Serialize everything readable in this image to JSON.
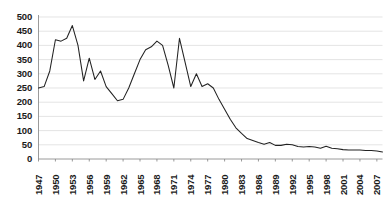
{
  "chart_data": {
    "type": "line",
    "title": "",
    "subtitle": "",
    "xlabel": "",
    "ylabel": "",
    "grid": true,
    "legend": false,
    "legend_position": "none",
    "line_color": "#222222",
    "background_color": "#ffffff",
    "gridline_color": "#d9d9d9",
    "axis_color": "#808080",
    "ylim": [
      0,
      500
    ],
    "yticks": [
      0,
      50,
      100,
      150,
      200,
      250,
      300,
      350,
      400,
      450,
      500
    ],
    "ytick_labels": [
      "0",
      "50",
      "100",
      "150",
      "200",
      "250",
      "300",
      "350",
      "400",
      "450",
      "500"
    ],
    "xlim": [
      1947,
      2008
    ],
    "xticks": [
      1947,
      1950,
      1953,
      1956,
      1959,
      1962,
      1965,
      1968,
      1971,
      1974,
      1977,
      1980,
      1983,
      1986,
      1989,
      1992,
      1995,
      1998,
      2001,
      2004,
      2007
    ],
    "xtick_labels": [
      "1947",
      "1950",
      "1953",
      "1956",
      "1959",
      "1962",
      "1965",
      "1968",
      "1971",
      "1974",
      "1977",
      "1980",
      "1983",
      "1986",
      "1989",
      "1992",
      "1995",
      "1998",
      "2001",
      "2004",
      "2007"
    ],
    "xtick_rotation": 90,
    "x": [
      1947,
      1948,
      1949,
      1950,
      1951,
      1952,
      1953,
      1954,
      1955,
      1956,
      1957,
      1958,
      1959,
      1960,
      1961,
      1962,
      1963,
      1964,
      1965,
      1966,
      1967,
      1968,
      1969,
      1970,
      1971,
      1972,
      1973,
      1974,
      1975,
      1976,
      1977,
      1978,
      1979,
      1980,
      1981,
      1982,
      1983,
      1984,
      1985,
      1986,
      1987,
      1988,
      1989,
      1990,
      1991,
      1992,
      1993,
      1994,
      1995,
      1996,
      1997,
      1998,
      1999,
      2000,
      2001,
      2002,
      2003,
      2004,
      2005,
      2006,
      2007,
      2008
    ],
    "values": [
      250,
      255,
      310,
      420,
      415,
      425,
      470,
      400,
      275,
      355,
      280,
      310,
      255,
      230,
      205,
      210,
      250,
      300,
      350,
      385,
      395,
      415,
      400,
      330,
      250,
      425,
      340,
      255,
      300,
      255,
      265,
      250,
      210,
      175,
      140,
      110,
      90,
      72,
      65,
      58,
      52,
      58,
      48,
      48,
      52,
      50,
      44,
      42,
      44,
      42,
      38,
      45,
      38,
      36,
      33,
      32,
      32,
      32,
      30,
      30,
      28,
      25
    ],
    "series_name": "value"
  }
}
